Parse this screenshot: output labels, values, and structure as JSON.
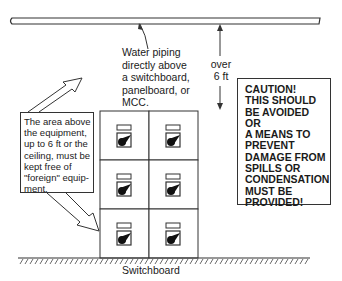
{
  "diagram": {
    "water_piping_label": "Water piping\ndirectly above\na switchboard,\npanelboard, or\nMCC.",
    "clearance_label": "over\n6 ft",
    "area_note": "The area above\nthe equipment,\nup to 6 ft or the\nceiling, must be\nkept free of\n\"foreign\" equip-\nment.",
    "caution_note": "CAUTION!\nTHIS SHOULD\nBE AVOIDED\nOR\nA MEANS TO\nPREVENT\nDAMAGE FROM\nSPILLS OR\nCONDENSATION\nMUST BE\nPROVIDED!",
    "equipment_label": "Switchboard",
    "breaker_sections": [
      {
        "row": 1,
        "column": 1
      },
      {
        "row": 1,
        "column": 2
      },
      {
        "row": 2,
        "column": 1
      },
      {
        "row": 2,
        "column": 2
      },
      {
        "row": 3,
        "column": 1
      },
      {
        "row": 3,
        "column": 2
      }
    ],
    "colors": {
      "line": "#333333",
      "background": "#ffffff"
    }
  }
}
